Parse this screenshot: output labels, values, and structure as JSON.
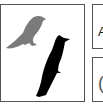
{
  "main_panel": {
    "images": [
      {
        "name": "gray-bird",
        "color": "#7a7a7a"
      },
      {
        "name": "black-bird",
        "color": "#000000"
      }
    ]
  },
  "side_boxes": [
    {
      "glyph": "A"
    },
    {
      "glyph": "("
    }
  ]
}
